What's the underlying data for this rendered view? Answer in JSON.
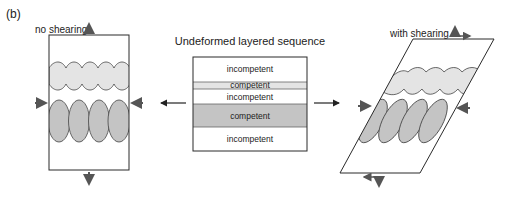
{
  "panel_label": "(b)",
  "left": {
    "title": "no shearing"
  },
  "center": {
    "title": "Undeformed layered sequence",
    "layers": [
      {
        "name": "incompetent",
        "type": "incompetent"
      },
      {
        "name": "competent",
        "type": "competent-thin"
      },
      {
        "name": "incompetent",
        "type": "incompetent"
      },
      {
        "name": "competent",
        "type": "competent-thick"
      },
      {
        "name": "incompetent",
        "type": "incompetent"
      }
    ]
  },
  "right": {
    "title": "with shearing"
  },
  "colors": {
    "outline": "#2a2a2a",
    "competent_thin": "#e4e4e4",
    "competent_thick": "#c4c4c4",
    "arrow": "#555555"
  }
}
